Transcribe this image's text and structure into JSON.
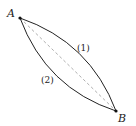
{
  "diagram": {
    "points": {
      "A": {
        "label": "A",
        "x": 20,
        "y": 18
      },
      "B": {
        "label": "B",
        "x": 116,
        "y": 111
      }
    },
    "curves": [
      {
        "label": "(1)",
        "description": "upper curve bulging right"
      },
      {
        "label": "(2)",
        "description": "lower curve bulging left"
      }
    ],
    "chord": {
      "style": "dashed",
      "description": "straight line A to B"
    }
  }
}
